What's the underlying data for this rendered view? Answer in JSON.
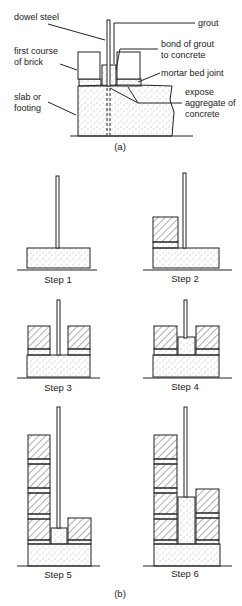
{
  "figure_a": {
    "caption": "(a)",
    "labels": {
      "dowel_steel": "dowel steel",
      "grout": "grout",
      "first_course_1": "first course",
      "first_course_2": "of brick",
      "bond_1": "bond of grout",
      "bond_2": "to concrete",
      "mortar": "mortar bed joint",
      "slab_1": "slab or",
      "slab_2": "footing",
      "expose_1": "expose",
      "expose_2": "aggregate of",
      "expose_3": "concrete"
    }
  },
  "figure_b": {
    "caption": "(b)",
    "steps": [
      "Step 1",
      "Step 2",
      "Step 3",
      "Step 4",
      "Step 5",
      "Step 6"
    ]
  },
  "colors": {
    "line": "#222222",
    "background": "#ffffff"
  }
}
